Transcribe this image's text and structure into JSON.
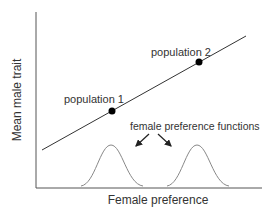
{
  "diagram": {
    "x_axis_label": "Female preference",
    "y_axis_label": "Mean male trait",
    "annotation": "female preference functions",
    "points": [
      {
        "label": "population 1"
      },
      {
        "label": "population 2"
      }
    ],
    "colors": {
      "axis": "#555555",
      "line": "#333333",
      "curve": "#888888",
      "dot": "#000000",
      "text": "#333333"
    }
  }
}
